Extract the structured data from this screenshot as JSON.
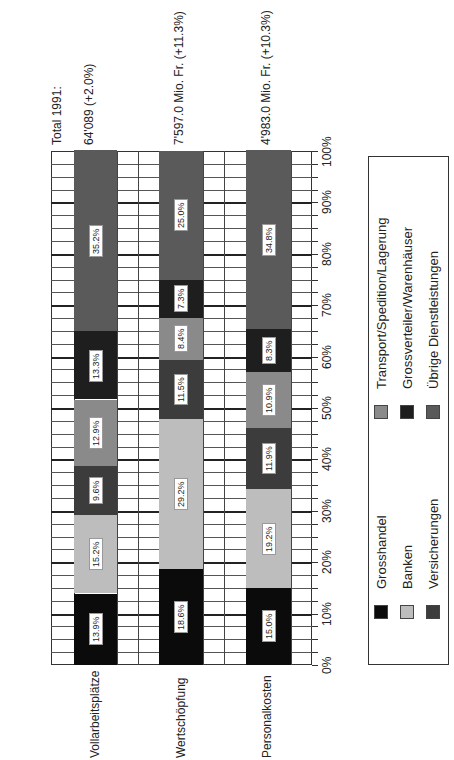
{
  "chart_data": {
    "type": "bar",
    "stacked": true,
    "orientation": "rotated-90-ccw (vertical stacked bars rendered sideways)",
    "title": "Total 1991:",
    "categories": [
      "Vollarbeitsplätze",
      "Wertschöpfung",
      "Personalkosten"
    ],
    "totals": [
      "64'089 (+2.0%)",
      "7'597.0 Mio. Fr. (+11.3%)",
      "4'983.0 Mio. Fr. (+10.3%)"
    ],
    "series": [
      {
        "name": "Grosshandel",
        "color": "#0b0b0b",
        "values": [
          13.9,
          18.6,
          15.0
        ]
      },
      {
        "name": "Banken",
        "color": "#bdbdbd",
        "values": [
          15.2,
          29.2,
          19.2
        ]
      },
      {
        "name": "Versicherungen",
        "color": "#3c3c3c",
        "values": [
          9.6,
          11.5,
          11.9
        ]
      },
      {
        "name": "Transport/Spedition/Lagerung",
        "color": "#8a8a8a",
        "values": [
          12.9,
          8.4,
          10.9
        ]
      },
      {
        "name": "Grossverteiler/Warenhäuser",
        "color": "#1e1e1e",
        "values": [
          13.3,
          7.3,
          8.3
        ]
      },
      {
        "name": "Übrige Dienstleistungen",
        "color": "#5a5a5a",
        "values": [
          35.2,
          25.0,
          34.8
        ]
      }
    ],
    "value_labels": [
      [
        "13.9%",
        "15.2%",
        "9.6%",
        "12.9%",
        "13.3%",
        "35.2%"
      ],
      [
        "18.6%",
        "29.2%",
        "11.5%",
        "8.4%",
        "7.3%",
        "25.0%"
      ],
      [
        "15.0%",
        "19.2%",
        "11.9%",
        "10.9%",
        "8.3%",
        "34.8%"
      ]
    ],
    "xlabel": "",
    "ylabel": "",
    "ylim": [
      0,
      100
    ],
    "yticks": [
      "0%",
      "10%",
      "20%",
      "30%",
      "40%",
      "50%",
      "60%",
      "70%",
      "80%",
      "90%",
      "100%"
    ],
    "grid": true,
    "legend_position": "right (bottom of rotated page)"
  },
  "header": {
    "total_title": "Total 1991:",
    "totals": [
      "64'089 (+2.0%)",
      "7'597.0 Mio. Fr. (+11.3%)",
      "4'983.0 Mio. Fr. (+10.3%)"
    ]
  },
  "legend": {
    "items": [
      {
        "label": "Grosshandel",
        "color": "#0b0b0b"
      },
      {
        "label": "Banken",
        "color": "#bdbdbd"
      },
      {
        "label": "Versicherungen",
        "color": "#3c3c3c"
      },
      {
        "label": "Transport/Spedition/Lagerung",
        "color": "#8a8a8a"
      },
      {
        "label": "Grossverteiler/Warenhäuser",
        "color": "#1e1e1e"
      },
      {
        "label": "Übrige Dienstleistungen",
        "color": "#5a5a5a"
      }
    ]
  }
}
